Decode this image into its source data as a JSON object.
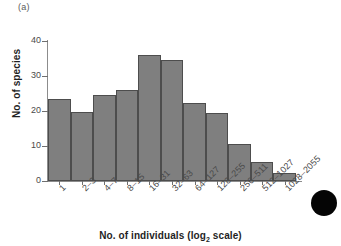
{
  "panel": {
    "label": "(a)"
  },
  "artifact": {
    "name": "scan-blob"
  },
  "chart_data": {
    "type": "bar",
    "title": "",
    "subtitle": "",
    "xlabel_text": "No. of individuals (log",
    "xlabel_sub": "2",
    "xlabel_tail": " scale)",
    "xlabel": "No. of individuals (log2 scale)",
    "ylabel": "No. of species",
    "categories": [
      "1",
      "2–3",
      "4–7",
      "8–15",
      "16–31",
      "32–63",
      "64–127",
      "128–255",
      "256–511",
      "512–1027",
      "1028–2055"
    ],
    "values": [
      23.5,
      19.8,
      24.5,
      26.0,
      36.0,
      34.5,
      22.3,
      19.5,
      10.5,
      5.3,
      2.3
    ],
    "ylim": [
      0,
      40
    ],
    "yticks": [
      0,
      10,
      20,
      30,
      40
    ],
    "ytick_labels": [
      "0",
      "10",
      "20",
      "30",
      "40"
    ],
    "grid": false,
    "legend": "none",
    "bar_color": "#7f7f7f",
    "bar_edge_color": "#4d4d4d",
    "axis_color": "#8c8c8c"
  }
}
